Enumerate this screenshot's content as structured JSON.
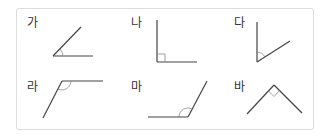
{
  "figures": [
    {
      "label": "가",
      "type": "acute",
      "vertex": [
        53,
        56
      ],
      "rays": [
        [
          93,
          56
        ],
        [
          81,
          27
        ]
      ]
    },
    {
      "label": "나",
      "type": "right",
      "vertex": [
        157,
        62
      ],
      "rays": [
        [
          157,
          20
        ],
        [
          197,
          62
        ]
      ]
    },
    {
      "label": "다",
      "type": "acute",
      "vertex": [
        257,
        62
      ],
      "rays": [
        [
          257,
          22
        ],
        [
          290,
          41
        ]
      ]
    },
    {
      "label": "라",
      "type": "obtuse",
      "vertex": [
        62,
        81
      ],
      "rays": [
        [
          103,
          81
        ],
        [
          43,
          118
        ]
      ]
    },
    {
      "label": "마",
      "type": "obtuse",
      "vertex": [
        188,
        117
      ],
      "rays": [
        [
          148,
          117
        ],
        [
          207,
          81
        ]
      ]
    },
    {
      "label": "바",
      "type": "right",
      "vertex": [
        274,
        85
      ],
      "rays": [
        [
          247,
          114
        ],
        [
          302,
          113
        ]
      ]
    }
  ],
  "colors": {
    "line": "#444444",
    "mark": "#888888",
    "border": "#dcdcdc"
  }
}
